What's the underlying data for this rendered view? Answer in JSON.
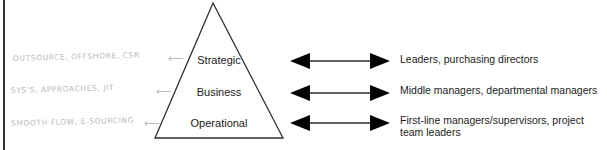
{
  "diagram": {
    "type": "pyramid-hierarchy",
    "colors": {
      "ink": "#1b1b1b",
      "outline": "#2e2e2e",
      "pencil": "#b9b9b9",
      "background": "#ffffff"
    },
    "page_edge": {
      "name": "scanned-page-edge",
      "visible": true
    },
    "pyramid": {
      "tiers": [
        {
          "label": "Strategic"
        },
        {
          "label": "Business"
        },
        {
          "label": "Operational"
        }
      ]
    },
    "arrows": [
      {
        "glyph": "double-headed-arrow"
      },
      {
        "glyph": "double-headed-arrow"
      },
      {
        "glyph": "double-headed-arrow"
      }
    ],
    "roles": [
      {
        "text": "Leaders, purchasing directors"
      },
      {
        "text": "Middle managers, departmental managers"
      },
      {
        "text": "First-line managers/supervisors, project team leaders"
      }
    ],
    "handwritten_notes": [
      {
        "text": "OUTSOURCE, OFFSHORE, CSR"
      },
      {
        "text": "SYS'S, APPROACHES, JIT"
      },
      {
        "text": "SMOOTH FLOW, E-SOURCING"
      }
    ],
    "pencil_arrows": [
      {
        "glyph": "⟵"
      },
      {
        "glyph": "⟵"
      },
      {
        "glyph": "⟵"
      }
    ]
  }
}
